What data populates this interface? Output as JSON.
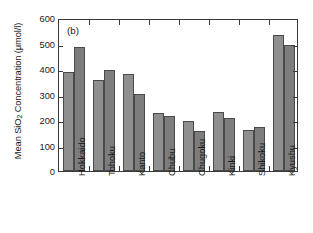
{
  "chart_data": {
    "type": "bar",
    "title": "",
    "panel_label": "(b)",
    "xlabel": "",
    "ylabel": "Mean SiO2 Concentration (μmol/l)",
    "ylabel_parts": {
      "pre": "Mean SiO",
      "sub": "2",
      "post": " Concentration (μmol/l)"
    },
    "categories": [
      "Hokkaido",
      "Tohoku",
      "Kanto",
      "Chubu",
      "Chugoku",
      "Kinki",
      "Shikoku",
      "Kyushu"
    ],
    "series": [
      {
        "name": "series-1",
        "values": [
          390,
          355,
          380,
          226,
          198,
          232,
          160,
          532
        ],
        "color": "#8f8f8f"
      },
      {
        "name": "series-2",
        "values": [
          486,
          398,
          303,
          215,
          155,
          207,
          172,
          495
        ],
        "color": "#7d7d7d"
      }
    ],
    "ylim": [
      0,
      600
    ],
    "yticks": [
      0,
      100,
      200,
      300,
      400,
      500,
      600
    ],
    "ytick_labels": [
      "0",
      "100",
      "200",
      "300",
      "400",
      "500",
      "600"
    ],
    "grid": false,
    "legend": "none",
    "axis_frame": "box",
    "tick_direction": "in"
  }
}
